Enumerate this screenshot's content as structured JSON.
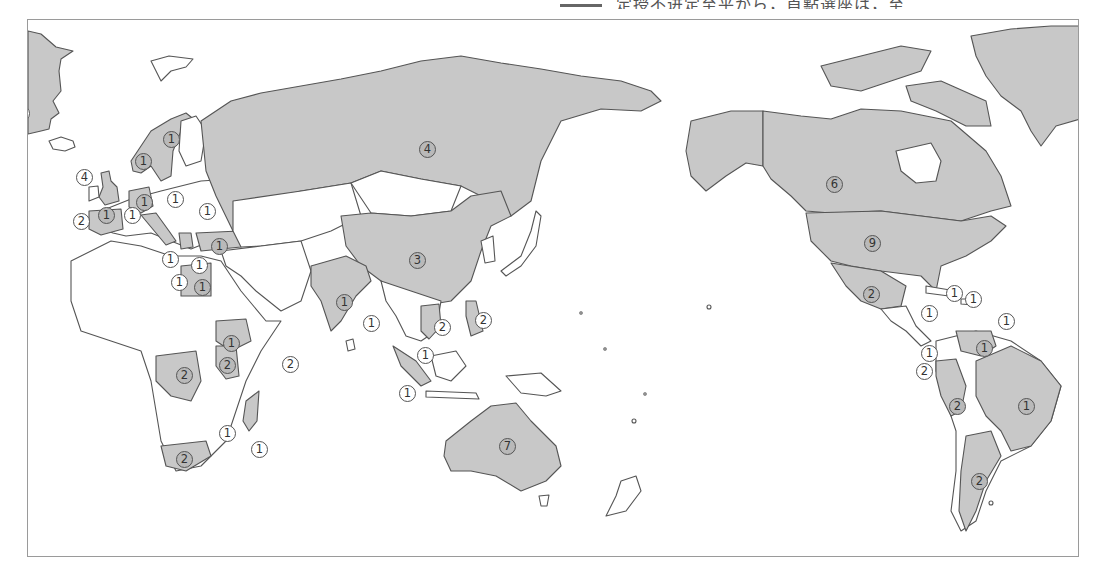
{
  "header": {
    "cropped_text": "定授不进定至平から，首點選座は，至"
  },
  "map": {
    "title": "World map: number of World Heritage (natural) sites by country",
    "colors": {
      "land_highlight": "#c8c8c8",
      "land_plain": "#ffffff",
      "outline": "#555555",
      "frame": "#9a9a9a"
    },
    "markers": [
      {
        "id": "greenland",
        "value": "①",
        "x": 12,
        "y": 104,
        "style": "plain"
      },
      {
        "id": "uk",
        "value": "④",
        "x": 75,
        "y": 168,
        "style": "plain"
      },
      {
        "id": "norway",
        "value": "①",
        "x": 134,
        "y": 152,
        "style": "dark"
      },
      {
        "id": "sweden",
        "value": "①",
        "x": 162,
        "y": 130,
        "style": "dark"
      },
      {
        "id": "germany",
        "value": "①",
        "x": 135,
        "y": 193,
        "style": "dark"
      },
      {
        "id": "poland",
        "value": "①",
        "x": 166,
        "y": 190,
        "style": "plain"
      },
      {
        "id": "ukraine",
        "value": "①",
        "x": 198,
        "y": 202,
        "style": "plain"
      },
      {
        "id": "switzerland",
        "value": "②",
        "x": 72,
        "y": 212,
        "style": "plain"
      },
      {
        "id": "spain",
        "value": "①",
        "x": 97,
        "y": 206,
        "style": "dark"
      },
      {
        "id": "france-corsica",
        "value": "①",
        "x": 123,
        "y": 206,
        "style": "plain"
      },
      {
        "id": "italy-sicily",
        "value": "①",
        "x": 161,
        "y": 250,
        "style": "plain"
      },
      {
        "id": "greece",
        "value": "①",
        "x": 190,
        "y": 256,
        "style": "plain"
      },
      {
        "id": "turkey",
        "value": "①",
        "x": 210,
        "y": 237,
        "style": "dark"
      },
      {
        "id": "tunisia",
        "value": "①",
        "x": 170,
        "y": 273,
        "style": "plain"
      },
      {
        "id": "egypt",
        "value": "①",
        "x": 193,
        "y": 278,
        "style": "dark"
      },
      {
        "id": "russia",
        "value": "④",
        "x": 418,
        "y": 140,
        "style": "dark"
      },
      {
        "id": "china",
        "value": "③",
        "x": 408,
        "y": 251,
        "style": "dark"
      },
      {
        "id": "india",
        "value": "①",
        "x": 335,
        "y": 293,
        "style": "dark"
      },
      {
        "id": "bangladesh",
        "value": "①",
        "x": 362,
        "y": 314,
        "style": "plain"
      },
      {
        "id": "vietnam",
        "value": "②",
        "x": 433,
        "y": 318,
        "style": "plain"
      },
      {
        "id": "philippines",
        "value": "②",
        "x": 474,
        "y": 311,
        "style": "plain"
      },
      {
        "id": "malaysia",
        "value": "①",
        "x": 416,
        "y": 346,
        "style": "plain"
      },
      {
        "id": "indonesia",
        "value": "①",
        "x": 398,
        "y": 384,
        "style": "plain"
      },
      {
        "id": "ethiopia",
        "value": "①",
        "x": 222,
        "y": 334,
        "style": "dark"
      },
      {
        "id": "kenya",
        "value": "②",
        "x": 218,
        "y": 356,
        "style": "dark"
      },
      {
        "id": "dr-congo",
        "value": "②",
        "x": 175,
        "y": 366,
        "style": "dark"
      },
      {
        "id": "seychelles",
        "value": "②",
        "x": 281,
        "y": 355,
        "style": "plain"
      },
      {
        "id": "malawi",
        "value": "①",
        "x": 218,
        "y": 424,
        "style": "plain"
      },
      {
        "id": "madagascar",
        "value": "①",
        "x": 250,
        "y": 440,
        "style": "plain"
      },
      {
        "id": "south-africa",
        "value": "②",
        "x": 175,
        "y": 450,
        "style": "dark"
      },
      {
        "id": "australia",
        "value": "⑦",
        "x": 498,
        "y": 437,
        "style": "dark"
      },
      {
        "id": "canada",
        "value": "⑥",
        "x": 825,
        "y": 175,
        "style": "dark"
      },
      {
        "id": "usa",
        "value": "⑨",
        "x": 863,
        "y": 234,
        "style": "dark"
      },
      {
        "id": "mexico",
        "value": "②",
        "x": 862,
        "y": 285,
        "style": "dark"
      },
      {
        "id": "cuba",
        "value": "①",
        "x": 945,
        "y": 284,
        "style": "plain"
      },
      {
        "id": "dominican-republic",
        "value": "①",
        "x": 964,
        "y": 290,
        "style": "plain"
      },
      {
        "id": "costa-rica",
        "value": "①",
        "x": 920,
        "y": 304,
        "style": "plain"
      },
      {
        "id": "saint-lucia",
        "value": "①",
        "x": 997,
        "y": 312,
        "style": "plain"
      },
      {
        "id": "panama",
        "value": "①",
        "x": 920,
        "y": 344,
        "style": "plain"
      },
      {
        "id": "venezuela",
        "value": "①",
        "x": 975,
        "y": 339,
        "style": "dark"
      },
      {
        "id": "ecuador",
        "value": "②",
        "x": 915,
        "y": 362,
        "style": "plain"
      },
      {
        "id": "peru",
        "value": "②",
        "x": 948,
        "y": 397,
        "style": "dark"
      },
      {
        "id": "brazil",
        "value": "①",
        "x": 1017,
        "y": 397,
        "style": "dark"
      },
      {
        "id": "argentina",
        "value": "②",
        "x": 970,
        "y": 472,
        "style": "dark"
      }
    ]
  }
}
